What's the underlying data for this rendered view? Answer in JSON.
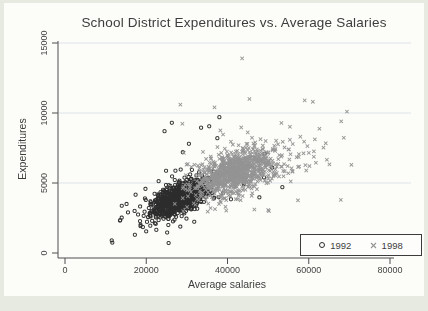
{
  "chart_data": {
    "type": "scatter",
    "title": "School District Expenditures vs. Average Salaries",
    "xlabel": "Average salaries",
    "ylabel": "Expenditures",
    "xlim": [
      0,
      80000
    ],
    "ylim": [
      0,
      15000
    ],
    "xticks": [
      0,
      20000,
      40000,
      60000,
      80000
    ],
    "yticks": [
      0,
      5000,
      10000,
      15000
    ],
    "grid": "horizontal",
    "legend_position": "bottom-right",
    "colors": {
      "axis": "#4f4f4f",
      "gridline": "#dde5e8",
      "text": "#3d3d3d",
      "series_1992": "#2d2d2d",
      "series_1998": "#949494",
      "page_background": "#e7eae1",
      "plot_background": "#fcfcf9"
    },
    "series": [
      {
        "name": "1992",
        "marker": "circle",
        "color": "#2d2d2d",
        "clusters": [
          {
            "cx": 28200,
            "cy": 3900,
            "sx": 3400,
            "sy": 630,
            "corr": 0.62,
            "n": 980,
            "tail_fraction": 0.13,
            "tail_scale": 2.1
          }
        ],
        "clip": {
          "x": [
            9500,
            56500
          ],
          "y": [
            600,
            9800
          ]
        },
        "outliers": [
          [
            11500,
            900
          ],
          [
            13600,
            2350
          ],
          [
            17200,
            1300
          ],
          [
            15500,
            2900
          ],
          [
            21000,
            1950
          ],
          [
            23500,
            2550
          ],
          [
            24500,
            8700
          ],
          [
            26300,
            9300
          ],
          [
            33500,
            8950
          ],
          [
            35500,
            9050
          ],
          [
            38000,
            9700
          ],
          [
            30500,
            7800
          ],
          [
            29000,
            7200
          ],
          [
            37500,
            8200
          ],
          [
            44000,
            4900
          ],
          [
            49000,
            5400
          ],
          [
            53500,
            4700
          ],
          [
            51000,
            6100
          ],
          [
            46000,
            6800
          ]
        ]
      },
      {
        "name": "1998",
        "marker": "x",
        "color": "#949494",
        "clusters": [
          {
            "cx": 41800,
            "cy": 5750,
            "sx": 5200,
            "sy": 880,
            "corr": 0.5,
            "n": 930,
            "tail_fraction": 0.13,
            "tail_scale": 2.0
          },
          {
            "cx": 61500,
            "cy": 6700,
            "sx": 2200,
            "sy": 850,
            "corr": 0.2,
            "n": 16,
            "tail_fraction": 0,
            "tail_scale": 1
          }
        ],
        "clip": {
          "x": [
            26500,
            72000
          ],
          "y": [
            2900,
            11200
          ]
        },
        "outliers": [
          [
            43600,
            13900
          ],
          [
            45400,
            11000
          ],
          [
            36800,
            10400
          ],
          [
            28400,
            10600
          ],
          [
            59000,
            10900
          ],
          [
            61000,
            10800
          ],
          [
            69400,
            10100
          ],
          [
            68000,
            9400
          ],
          [
            70500,
            6300
          ]
        ]
      }
    ]
  }
}
